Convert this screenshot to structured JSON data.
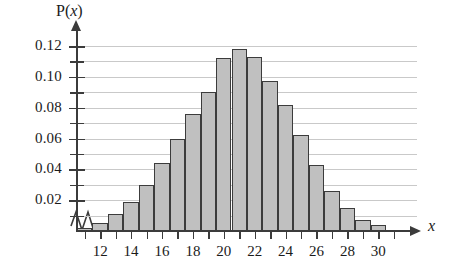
{
  "figure": {
    "axis_title_y_prefix": "P(",
    "axis_title_y_var": "x",
    "axis_title_y_suffix": ")",
    "axis_title_x": "x",
    "bar_fill_color": "#c0c0c0",
    "bar_edge_color": "#3c3c3c",
    "grid_color": "#c9c9c9",
    "axis_color": "#3b3b3b",
    "break_symbol": "axis-break-zigzag"
  },
  "chart_data": {
    "type": "bar",
    "title": "",
    "xlabel": "x",
    "ylabel": "P(x)",
    "xlim": [
      10.5,
      31.5
    ],
    "ylim": [
      0,
      0.12
    ],
    "grid": true,
    "legend": null,
    "y_tick_labels": [
      "0.12",
      "0.10",
      "0.08",
      "0.06",
      "0.04",
      "0.02"
    ],
    "y_tick_values": [
      0.12,
      0.1,
      0.08,
      0.06,
      0.04,
      0.02
    ],
    "y_minor_tick_values": [
      0.11,
      0.09,
      0.07,
      0.05,
      0.03,
      0.01
    ],
    "x_tick_labels": [
      "12",
      "14",
      "16",
      "18",
      "20",
      "22",
      "24",
      "26",
      "28",
      "30"
    ],
    "x_tick_values": [
      12,
      14,
      16,
      18,
      20,
      22,
      24,
      26,
      28,
      30
    ],
    "x_minor_tick_values": [
      11,
      13,
      15,
      17,
      19,
      21,
      23,
      25,
      27,
      29,
      31
    ],
    "categories": [
      11,
      12,
      13,
      14,
      15,
      16,
      17,
      18,
      19,
      20,
      21,
      22,
      23,
      24,
      25,
      26,
      27,
      28,
      29,
      30
    ],
    "values": [
      0.002,
      0.005,
      0.011,
      0.019,
      0.03,
      0.044,
      0.06,
      0.076,
      0.09,
      0.112,
      0.118,
      0.113,
      0.097,
      0.082,
      0.062,
      0.043,
      0.026,
      0.015,
      0.007,
      0.004
    ]
  }
}
